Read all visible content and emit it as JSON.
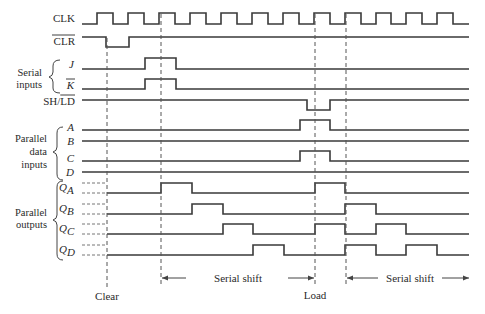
{
  "diagram": {
    "type": "timing-diagram",
    "signals": [
      {
        "id": "clk",
        "label": "CLK",
        "overbar": false,
        "italic": false
      },
      {
        "id": "clr",
        "label": "CLR",
        "overbar": true,
        "italic": false
      },
      {
        "id": "j",
        "label": "J",
        "overbar": false,
        "italic": true
      },
      {
        "id": "k",
        "label": "K",
        "overbar": true,
        "italic": true
      },
      {
        "id": "shld",
        "label_prefix": "SH/",
        "label_bar": "LD",
        "italic": false
      },
      {
        "id": "a",
        "label": "A",
        "italic": true
      },
      {
        "id": "b",
        "label": "B",
        "italic": true
      },
      {
        "id": "c",
        "label": "C",
        "italic": true
      },
      {
        "id": "d",
        "label": "D",
        "italic": true
      },
      {
        "id": "qa",
        "label": "Q",
        "sub": "A",
        "italic": true
      },
      {
        "id": "qb",
        "label": "Q",
        "sub": "B",
        "italic": true
      },
      {
        "id": "qc",
        "label": "Q",
        "sub": "C",
        "italic": true
      },
      {
        "id": "qd",
        "label": "Q",
        "sub": "D",
        "italic": true
      }
    ],
    "groups": [
      {
        "id": "serial-inputs",
        "line1": "Serial",
        "line2": "inputs"
      },
      {
        "id": "parallel-data-inputs",
        "line1": "Parallel",
        "line2": "data",
        "line3": "inputs"
      },
      {
        "id": "parallel-outputs",
        "line1": "Parallel",
        "line2": "outputs"
      }
    ],
    "markers": [
      {
        "id": "clear",
        "label": "Clear",
        "x": 107
      },
      {
        "id": "load",
        "label": "Load",
        "x": 315
      }
    ],
    "spans": [
      {
        "id": "serial-shift-1",
        "label": "Serial shift",
        "from": 161,
        "to": 315
      },
      {
        "id": "serial-shift-2",
        "label": "Serial shift",
        "from": 346,
        "to": 469
      }
    ],
    "waveforms": {
      "clk": {
        "clock_period_px": 31,
        "rising_edges_x": [
          97,
          128,
          159,
          190,
          221,
          252,
          283,
          314,
          345,
          376,
          406,
          437
        ]
      },
      "clr": {
        "low_from": 106,
        "low_to": 129
      },
      "j": {
        "high_from": 145,
        "high_to": 176
      },
      "k": {
        "high_from": 145,
        "high_to": 176
      },
      "shld": {
        "low_from": 307,
        "low_to": 330
      },
      "a": {
        "high_from": 300,
        "high_to": 330
      },
      "b": {
        "constant": "low"
      },
      "c": {
        "high_from": 300,
        "high_to": 330
      },
      "d": {
        "constant": "low"
      },
      "qa": {
        "high_intervals": [
          [
            161,
            192
          ],
          [
            315,
            345
          ]
        ]
      },
      "qb": {
        "high_intervals": [
          [
            192,
            223
          ],
          [
            345,
            376
          ]
        ]
      },
      "qc": {
        "high_intervals": [
          [
            223,
            253
          ],
          [
            315,
            345
          ],
          [
            376,
            406
          ]
        ]
      },
      "qd": {
        "high_intervals": [
          [
            253,
            284
          ],
          [
            345,
            376
          ],
          [
            406,
            437
          ]
        ]
      }
    }
  }
}
